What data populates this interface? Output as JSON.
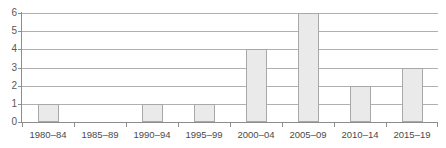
{
  "chart_data": {
    "type": "bar",
    "title": "",
    "xlabel": "",
    "ylabel": "",
    "categories": [
      "1980–84",
      "1985–89",
      "1990–94",
      "1995–99",
      "2000–04",
      "2005–09",
      "2010–14",
      "2015–19"
    ],
    "values": [
      1,
      0,
      1,
      1,
      4,
      6,
      2,
      3
    ],
    "ylim": [
      0,
      6
    ],
    "ytick_labels": [
      "0",
      "1",
      "2",
      "3",
      "4",
      "5",
      "6"
    ],
    "ytick_values": [
      0,
      1,
      2,
      3,
      4,
      5,
      6
    ],
    "grid": true,
    "grid_axis": "y",
    "legend": false,
    "legend_position": "none",
    "bar_fill_color": "#eaeaea",
    "bar_border_color": "#a8a8a8",
    "gridline_color": "#b0b0b0",
    "axis_color": "#8d8d8d",
    "text_color": "#4a4a4a",
    "background_color": "#ffffff"
  },
  "figure": {
    "clipped_title_text": ""
  }
}
